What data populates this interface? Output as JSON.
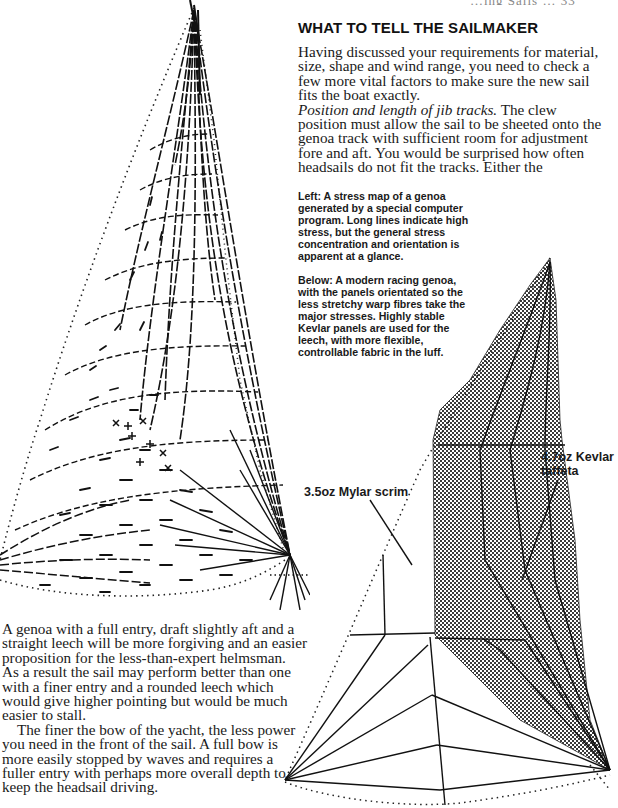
{
  "running_head": {
    "text": "…ing Sails … 33"
  },
  "section": {
    "heading": "WHAT TO TELL THE SAILMAKER"
  },
  "intro": {
    "lines": [
      "Having discussed your requirements for material,",
      "size, shape and wind range, you need to check a",
      "few more vital factors to make sure the new sail",
      "fits the boat exactly."
    ],
    "subhead_italic": "Position and length of jib tracks.",
    "subhead_rest": " The clew",
    "lines2": [
      "position must allow the sail to be sheeted onto the",
      "genoa track with sufficient room for adjustment",
      "fore and aft. You would be surprised how often",
      "headsails do not fit the tracks. Either the"
    ]
  },
  "captions": {
    "left": [
      "Left: A stress map of a genoa",
      "generated by a special computer",
      "program. Long lines indicate high",
      "stress, but the general stress",
      "concentration and orientation is",
      "apparent at a glance."
    ],
    "below": [
      "Below: A modern racing genoa,",
      "with the panels orientated so the",
      "less stretchy warp fibres take the",
      "major stresses. Highly stable",
      "Kevlar panels are used for the",
      "leech, with more flexible,",
      "controllable fabric in the luff."
    ]
  },
  "diagram_labels": {
    "mylar": "3.5oz Mylar scrim",
    "kevlar_line1": "4.7oz Kevlar",
    "kevlar_line2": "taffeta"
  },
  "bottom": {
    "para1": [
      "A genoa with a full entry, draft slightly aft and a",
      "straight leech will be more forgiving and an easier",
      "proposition for the less-than-expert helmsman.",
      "As a result the sail may perform better than one",
      "with a finer entry and a rounded leech which",
      "would give higher pointing but would be much",
      "easier to stall."
    ],
    "para2": [
      "The finer the bow of the yacht, the less power",
      "you need in the front of the sail. A full bow is",
      "more easily stopped by waves and requires a",
      "fuller entry with perhaps more overall depth to",
      "keep the headsail driving."
    ]
  },
  "figures": {
    "stress_map": {
      "description": "Stress map of a genoa (computer generated)"
    },
    "panel_layout": {
      "description": "Modern racing genoa panel layout",
      "kevlar_fill": "#7a7a7a"
    }
  }
}
